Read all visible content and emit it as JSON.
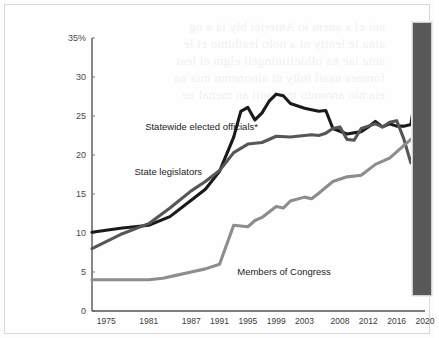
{
  "chart_data": {
    "type": "line",
    "title": "",
    "subtitle": "",
    "xlabel": "",
    "ylabel": "",
    "x": [
      1975,
      1981,
      1987,
      1991,
      1995,
      1999,
      2003,
      2008,
      2012,
      2016,
      2020
    ],
    "xtick_labels": [
      "1975",
      "1981",
      "1987",
      "1991",
      "1995",
      "1999",
      "2003",
      "2008",
      "2012",
      "2016",
      "2020"
    ],
    "ytick_labels": [
      "0",
      "5",
      "10",
      "15",
      "20",
      "25",
      "30",
      "35%"
    ],
    "ytick_values": [
      0,
      5,
      10,
      15,
      20,
      25,
      30,
      35
    ],
    "ylim": [
      0,
      35
    ],
    "xlim": [
      1973,
      2020
    ],
    "grid": false,
    "legend_position": "inline-annotations",
    "series": [
      {
        "name": "Statewide elected officials*",
        "color": "#1a1a1a",
        "label_x": 1980.5,
        "label_y": 23.2,
        "points": [
          {
            "x": 1973.0,
            "y": 10.1
          },
          {
            "x": 1977.0,
            "y": 10.6
          },
          {
            "x": 1981.0,
            "y": 11.0
          },
          {
            "x": 1984.0,
            "y": 12.1
          },
          {
            "x": 1987.0,
            "y": 14.2
          },
          {
            "x": 1989.0,
            "y": 15.6
          },
          {
            "x": 1991.0,
            "y": 17.9
          },
          {
            "x": 1993.0,
            "y": 22.3
          },
          {
            "x": 1994.0,
            "y": 25.6
          },
          {
            "x": 1995.0,
            "y": 26.1
          },
          {
            "x": 1996.0,
            "y": 24.5
          },
          {
            "x": 1997.0,
            "y": 25.4
          },
          {
            "x": 1998.0,
            "y": 26.9
          },
          {
            "x": 1999.0,
            "y": 27.8
          },
          {
            "x": 2000.0,
            "y": 27.6
          },
          {
            "x": 2001.0,
            "y": 26.6
          },
          {
            "x": 2003.0,
            "y": 26.0
          },
          {
            "x": 2005.0,
            "y": 25.6
          },
          {
            "x": 2006.0,
            "y": 25.7
          },
          {
            "x": 2007.0,
            "y": 23.4
          },
          {
            "x": 2009.0,
            "y": 22.7
          },
          {
            "x": 2011.0,
            "y": 23.0
          },
          {
            "x": 2012.0,
            "y": 23.6
          },
          {
            "x": 2013.0,
            "y": 24.3
          },
          {
            "x": 2014.0,
            "y": 23.6
          },
          {
            "x": 2015.0,
            "y": 24.0
          },
          {
            "x": 2016.0,
            "y": 23.7
          },
          {
            "x": 2017.0,
            "y": 23.7
          },
          {
            "x": 2018.0,
            "y": 23.9
          },
          {
            "x": 2020.0,
            "y": 35.0
          }
        ]
      },
      {
        "name": "State legislators",
        "color": "#565656",
        "label_x": 1979.0,
        "label_y": 17.4,
        "points": [
          {
            "x": 1973.0,
            "y": 8.0
          },
          {
            "x": 1977.0,
            "y": 9.8
          },
          {
            "x": 1981.0,
            "y": 11.2
          },
          {
            "x": 1984.0,
            "y": 13.2
          },
          {
            "x": 1987.0,
            "y": 15.4
          },
          {
            "x": 1989.0,
            "y": 16.6
          },
          {
            "x": 1991.0,
            "y": 18.0
          },
          {
            "x": 1993.0,
            "y": 20.3
          },
          {
            "x": 1995.0,
            "y": 21.4
          },
          {
            "x": 1997.0,
            "y": 21.6
          },
          {
            "x": 1999.0,
            "y": 22.4
          },
          {
            "x": 2001.0,
            "y": 22.3
          },
          {
            "x": 2003.0,
            "y": 22.5
          },
          {
            "x": 2004.0,
            "y": 22.6
          },
          {
            "x": 2005.0,
            "y": 22.5
          },
          {
            "x": 2006.0,
            "y": 22.8
          },
          {
            "x": 2007.0,
            "y": 23.4
          },
          {
            "x": 2008.0,
            "y": 23.6
          },
          {
            "x": 2009.0,
            "y": 22.0
          },
          {
            "x": 2010.0,
            "y": 21.9
          },
          {
            "x": 2011.0,
            "y": 23.4
          },
          {
            "x": 2012.0,
            "y": 23.7
          },
          {
            "x": 2013.0,
            "y": 24.0
          },
          {
            "x": 2014.0,
            "y": 23.6
          },
          {
            "x": 2015.0,
            "y": 24.2
          },
          {
            "x": 2016.0,
            "y": 24.4
          },
          {
            "x": 2017.0,
            "y": 22.1
          },
          {
            "x": 2018.0,
            "y": 19.0
          },
          {
            "x": 2020.0,
            "y": 25.1
          }
        ]
      },
      {
        "name": "Members of Congress",
        "color": "#8d8d8d",
        "label_x": 1993.5,
        "label_y": 4.6,
        "points": [
          {
            "x": 1973.0,
            "y": 4.0
          },
          {
            "x": 1977.0,
            "y": 4.0
          },
          {
            "x": 1981.0,
            "y": 4.0
          },
          {
            "x": 1983.0,
            "y": 4.2
          },
          {
            "x": 1985.0,
            "y": 4.6
          },
          {
            "x": 1987.0,
            "y": 5.0
          },
          {
            "x": 1989.0,
            "y": 5.4
          },
          {
            "x": 1991.0,
            "y": 6.0
          },
          {
            "x": 1993.0,
            "y": 11.0
          },
          {
            "x": 1995.0,
            "y": 10.8
          },
          {
            "x": 1996.0,
            "y": 11.6
          },
          {
            "x": 1997.0,
            "y": 12.0
          },
          {
            "x": 1999.0,
            "y": 13.4
          },
          {
            "x": 2000.0,
            "y": 13.2
          },
          {
            "x": 2001.0,
            "y": 14.1
          },
          {
            "x": 2003.0,
            "y": 14.6
          },
          {
            "x": 2004.0,
            "y": 14.4
          },
          {
            "x": 2005.0,
            "y": 15.1
          },
          {
            "x": 2007.0,
            "y": 16.6
          },
          {
            "x": 2009.0,
            "y": 17.2
          },
          {
            "x": 2011.0,
            "y": 17.4
          },
          {
            "x": 2013.0,
            "y": 18.8
          },
          {
            "x": 2015.0,
            "y": 19.6
          },
          {
            "x": 2017.0,
            "y": 21.2
          },
          {
            "x": 2018.0,
            "y": 22.0
          },
          {
            "x": 2020.0,
            "y": 23.5
          }
        ]
      }
    ]
  },
  "side_panel": {
    "color": "#585858"
  }
}
